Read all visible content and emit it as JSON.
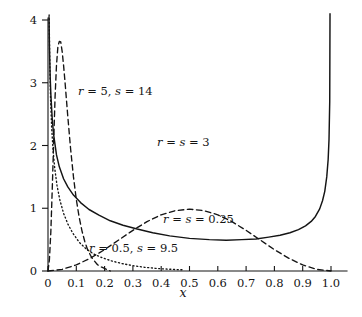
{
  "figure": {
    "background_color": "#ffffff",
    "ink_color": "#141414"
  },
  "chart_data": {
    "type": "line",
    "title": "",
    "subtitle": "",
    "xlabel": "x",
    "ylabel": "",
    "xlim": [
      0,
      1.06
    ],
    "ylim": [
      0,
      4.12
    ],
    "grid": false,
    "legend": "inline-annotations",
    "x_ticks": [
      0,
      0.1,
      0.2,
      0.3,
      0.4,
      0.5,
      0.6,
      0.7,
      0.8,
      0.9,
      1.0
    ],
    "x_tick_labels": [
      "0",
      "0.1",
      "0.2",
      "0.3",
      "0.4",
      "0.5",
      "0.6",
      "0.7",
      "0.8",
      "0.9",
      "1.0"
    ],
    "y_ticks": [
      0,
      1,
      2,
      3,
      4
    ],
    "y_tick_labels": [
      "0",
      "1",
      "2",
      "3",
      "4"
    ],
    "series": [
      {
        "name": "r = 5, s = 14",
        "label": "r = 5, s = 14",
        "style": "dashed",
        "r": 5,
        "s": 14,
        "peak_x": 0.045,
        "peak_y": 3.65,
        "x": [
          0.0,
          0.005,
          0.01,
          0.015,
          0.02,
          0.025,
          0.03,
          0.035,
          0.04,
          0.045,
          0.05,
          0.055,
          0.06,
          0.065,
          0.07,
          0.08,
          0.09,
          0.1,
          0.11,
          0.12,
          0.13,
          0.14,
          0.15,
          0.16,
          0.175,
          0.19,
          0.205,
          0.22
        ],
        "y": [
          0.0,
          0.18,
          0.62,
          1.3,
          2.05,
          2.78,
          3.28,
          3.58,
          3.66,
          3.65,
          3.5,
          3.28,
          3.02,
          2.74,
          2.46,
          1.94,
          1.5,
          1.14,
          0.86,
          0.64,
          0.47,
          0.34,
          0.25,
          0.18,
          0.1,
          0.06,
          0.03,
          0.0
        ]
      },
      {
        "name": "r = s = 3",
        "label": "r = s = 3",
        "style": "dashed",
        "r": 3,
        "s": 3,
        "peak_x": 0.5,
        "peak_y": 1.875,
        "x": [
          0.0,
          0.05,
          0.1,
          0.15,
          0.2,
          0.25,
          0.3,
          0.35,
          0.4,
          0.45,
          0.5,
          0.55,
          0.6,
          0.65,
          0.7,
          0.75,
          0.8,
          0.85,
          0.9,
          0.95,
          1.0
        ],
        "y": [
          0.0,
          0.026,
          0.097,
          0.205,
          0.341,
          0.494,
          0.648,
          0.787,
          0.896,
          0.962,
          0.985,
          0.962,
          0.896,
          0.787,
          0.648,
          0.494,
          0.341,
          0.205,
          0.097,
          0.026,
          0.0
        ]
      },
      {
        "name": "r = s = 0.25",
        "label": "r = s = 0.25",
        "style": "solid",
        "r": 0.25,
        "s": 0.25,
        "min_x": 0.5,
        "min_y": 0.42,
        "x": [
          0.0035,
          0.005,
          0.0075,
          0.01,
          0.015,
          0.02,
          0.03,
          0.04,
          0.055,
          0.07,
          0.09,
          0.115,
          0.145,
          0.18,
          0.22,
          0.265,
          0.315,
          0.37,
          0.43,
          0.5,
          0.57,
          0.63,
          0.685,
          0.735,
          0.78,
          0.82,
          0.855,
          0.885,
          0.91,
          0.93,
          0.945,
          0.96,
          0.97,
          0.978,
          0.985,
          0.99,
          0.993,
          0.9955,
          0.9965
        ],
        "y": [
          4.05,
          3.6,
          3.12,
          2.82,
          2.42,
          2.17,
          1.85,
          1.66,
          1.47,
          1.34,
          1.21,
          1.09,
          0.98,
          0.89,
          0.8,
          0.73,
          0.67,
          0.61,
          0.56,
          0.52,
          0.5,
          0.49,
          0.5,
          0.51,
          0.54,
          0.57,
          0.61,
          0.66,
          0.72,
          0.79,
          0.87,
          0.99,
          1.12,
          1.27,
          1.5,
          1.78,
          2.1,
          2.7,
          4.1
        ]
      },
      {
        "name": "r = 0.5, s = 9.5",
        "label": "r = 0.5, s = 9.5",
        "style": "dotted",
        "r": 0.5,
        "s": 9.5,
        "x": [
          0.004,
          0.006,
          0.009,
          0.013,
          0.018,
          0.024,
          0.032,
          0.042,
          0.055,
          0.07,
          0.088,
          0.11,
          0.135,
          0.162,
          0.192,
          0.225,
          0.26,
          0.3,
          0.34,
          0.385,
          0.43,
          0.48
        ],
        "y": [
          4.08,
          3.4,
          2.75,
          2.28,
          1.92,
          1.63,
          1.36,
          1.13,
          0.92,
          0.75,
          0.6,
          0.46,
          0.35,
          0.27,
          0.21,
          0.16,
          0.12,
          0.085,
          0.06,
          0.04,
          0.028,
          0.018
        ]
      }
    ],
    "annotations": [
      {
        "text": "r = 5, s = 14",
        "x_px": 78,
        "y_px": 95
      },
      {
        "text": "r = s = 3",
        "x_px": 157,
        "y_px": 146
      },
      {
        "text": "r = s = 0.25",
        "x_px": 163,
        "y_px": 223
      },
      {
        "text": "r = 0.5, s = 9.5",
        "x_px": 89,
        "y_px": 252
      }
    ]
  }
}
